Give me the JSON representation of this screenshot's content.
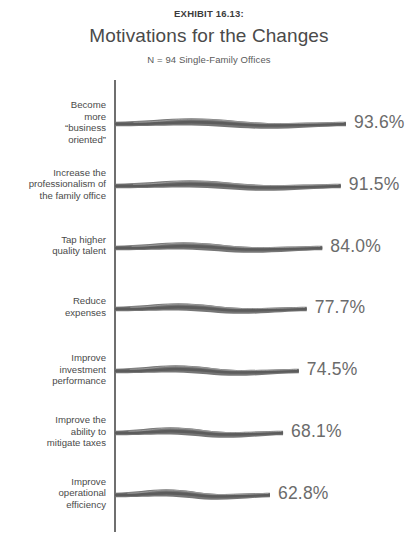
{
  "header": {
    "exhibit_label": "EXHIBIT 16.13:",
    "title": "Motivations for the Changes",
    "subtitle": "N = 94 Single-Family Offices"
  },
  "colors": {
    "bar_dark": "#5c5c5c",
    "bar_mid": "#767676",
    "bar_light": "#9a9a9a",
    "axis": "#6f6f6f",
    "label_text": "#4a4a4a",
    "value_text": "#6b6b6b"
  },
  "chart_data": {
    "type": "bar",
    "orientation": "horizontal",
    "title": "Motivations for the Changes",
    "subtitle": "N = 94 Single-Family Offices",
    "exhibit": "EXHIBIT 16.13:",
    "xlabel": "",
    "ylabel": "",
    "xlim": [
      0,
      100
    ],
    "grid": false,
    "legend": false,
    "unit": "%",
    "categories": [
      "Become\nmore\n“business\noriented”",
      "Increase the\nprofessionalism of\nthe family office",
      "Tap higher\nquality talent",
      "Reduce\nexpenses",
      "Improve\ninvestment\nperformance",
      "Improve the\nability to\nmitigate taxes",
      "Improve\noperational\nefficiency"
    ],
    "values": [
      93.6,
      91.5,
      84.0,
      77.7,
      74.5,
      68.1,
      62.8
    ],
    "value_labels": [
      "93.6%",
      "91.5%",
      "84.0%",
      "77.7%",
      "74.5%",
      "68.1%",
      "62.8%"
    ]
  }
}
